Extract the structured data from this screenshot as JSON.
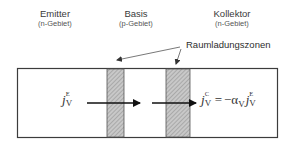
{
  "regions": {
    "emitter": {
      "name": "Emitter",
      "type": "(n-Gebiet)"
    },
    "basis": {
      "name": "Basis",
      "type": "(p-Gebiet)"
    },
    "kollektor": {
      "name": "Kollektor",
      "type": "(n-Gebiet)"
    }
  },
  "space_charge_label": "Raumladungszonen",
  "formulas": {
    "emitter_current": {
      "symbol": "j",
      "superscript": "E",
      "subscript": "V"
    },
    "collector_current": {
      "symbol": "j",
      "superscript": "C",
      "subscript": "V",
      "equals": "=",
      "minus": "−",
      "alpha": "α",
      "alpha_subscript": "V",
      "rhs_symbol": "j",
      "rhs_superscript": "E",
      "rhs_subscript": "V"
    }
  },
  "colors": {
    "outline": "#3c3c3c",
    "hatch_fill": "#bdbdbd",
    "hatch_line": "#8a8a8a",
    "arrow": "#111111",
    "leader": "#555555"
  }
}
